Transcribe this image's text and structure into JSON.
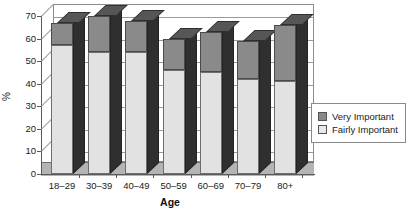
{
  "chart_data": {
    "type": "bar",
    "subtype": "stacked-3d-column",
    "title": "",
    "xlabel": "Age",
    "ylabel": "%",
    "categories": [
      "18–29",
      "30–39",
      "40–49",
      "50–59",
      "60–69",
      "70–79",
      "80+"
    ],
    "series": [
      {
        "name": "Fairly Important",
        "color": "#e2e2e2",
        "values": [
          57,
          54,
          54,
          46,
          45,
          42,
          41
        ]
      },
      {
        "name": "Very Important",
        "color": "#8a8a8a",
        "values": [
          10,
          16,
          14,
          14,
          18,
          17,
          25
        ]
      }
    ],
    "totals": [
      67,
      70,
      68,
      60,
      63,
      59,
      66
    ],
    "stack_order": [
      "Fairly Important",
      "Very Important"
    ],
    "ylim": [
      0,
      70
    ],
    "yticks": [
      0,
      10,
      20,
      30,
      40,
      50,
      60,
      70
    ],
    "ytick_labels": [
      "0",
      "10",
      "20",
      "30",
      "40",
      "50",
      "60",
      "70"
    ],
    "grid": true,
    "grid_axis": "y",
    "legend_position": "right"
  },
  "legend": {
    "entries": [
      {
        "label": "Very Important",
        "swatch": "very"
      },
      {
        "label": "Fairly Important",
        "swatch": "fairly"
      }
    ]
  },
  "axes": {
    "x_title": "Age",
    "y_title": "%"
  }
}
